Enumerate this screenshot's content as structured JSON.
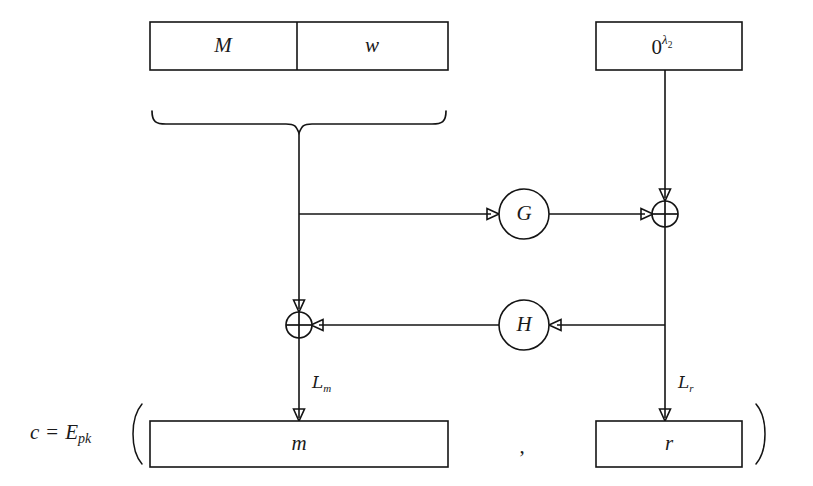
{
  "diagram": {
    "colors": {
      "background": "#ffffff",
      "stroke": "#141414",
      "text": "#1a1a1a",
      "box_fill": "#ffffff"
    },
    "top_row": {
      "message_box": {
        "left_label": "M",
        "right_label": "w"
      },
      "zero_box": {
        "base": "0",
        "exponent_symbol": "λ",
        "exponent_subscript": "2",
        "full_label": "0^λ2"
      }
    },
    "functions": {
      "g": "G",
      "h": "H"
    },
    "operators": {
      "xor_top": "⊕",
      "xor_bottom": "⊕"
    },
    "wire_labels": {
      "left": {
        "symbol": "L",
        "subscript": "m",
        "full": "Lm"
      },
      "right": {
        "symbol": "L",
        "subscript": "r",
        "full": "Lr"
      }
    },
    "bottom_row": {
      "equation": {
        "lhs": "c",
        "equals": "=",
        "operator": "E",
        "operator_subscript": "pk",
        "open_paren": "(",
        "close_paren": ")",
        "separator": ","
      },
      "message_out_box": "m",
      "random_out_box": "r"
    }
  }
}
